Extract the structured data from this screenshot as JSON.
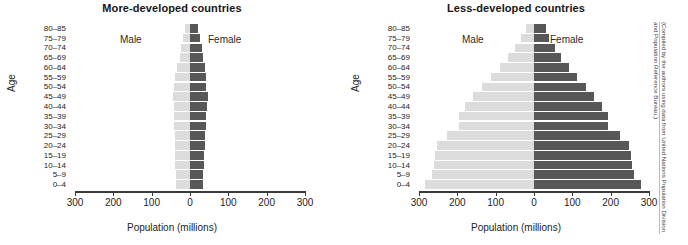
{
  "figure": {
    "credit": "(Compiled by the authors using data from United Nations Population Division and Population Reference Bureau.)"
  },
  "axis": {
    "xlabel": "Population (millions)",
    "ylabel": "Age",
    "ticks": [
      "300",
      "200",
      "100",
      "0",
      "100",
      "200",
      "300"
    ],
    "legend_male": "Male",
    "legend_female": "Female"
  },
  "chart_data": [
    {
      "type": "bar",
      "title": "More-developed countries",
      "xlabel": "Population (millions)",
      "ylabel": "Age",
      "xlim": [
        -300,
        300
      ],
      "xticks": [
        -300,
        -200,
        -100,
        0,
        100,
        200,
        300
      ],
      "xticklabels": [
        "300",
        "200",
        "100",
        "0",
        "100",
        "200",
        "300"
      ],
      "grid": false,
      "legend_position": "in-plot",
      "categories": [
        "80–85",
        "75–79",
        "70–74",
        "65–69",
        "60–64",
        "55–59",
        "50–54",
        "45–49",
        "40–44",
        "35–39",
        "30–34",
        "25–29",
        "20–24",
        "15–19",
        "10–14",
        "5–9",
        "0–4"
      ],
      "series": [
        {
          "name": "Male",
          "side": "left",
          "color": "#dcdcdc",
          "values": [
            12,
            19,
            24,
            27,
            34,
            38,
            41,
            45,
            43,
            42,
            41,
            40,
            39,
            39,
            38,
            36,
            36
          ]
        },
        {
          "name": "Female",
          "side": "right",
          "color": "#575757",
          "values": [
            22,
            27,
            31,
            33,
            38,
            41,
            43,
            46,
            44,
            42,
            41,
            40,
            38,
            37,
            36,
            34,
            34
          ]
        }
      ]
    },
    {
      "type": "bar",
      "title": "Less-developed countries",
      "xlabel": "Population (millions)",
      "ylabel": "Age",
      "xlim": [
        -300,
        300
      ],
      "xticks": [
        -300,
        -200,
        -100,
        0,
        100,
        200,
        300
      ],
      "xticklabels": [
        "300",
        "200",
        "100",
        "0",
        "100",
        "200",
        "300"
      ],
      "grid": false,
      "legend_position": "in-plot",
      "categories": [
        "80–85",
        "75–79",
        "70–74",
        "65–69",
        "60–64",
        "55–59",
        "50–54",
        "45–49",
        "40–44",
        "35–39",
        "30–34",
        "25–29",
        "20–24",
        "15–19",
        "10–14",
        "5–9",
        "0–4"
      ],
      "series": [
        {
          "name": "Male",
          "side": "left",
          "color": "#dcdcdc",
          "values": [
            22,
            34,
            50,
            68,
            88,
            112,
            135,
            158,
            180,
            196,
            196,
            228,
            252,
            258,
            260,
            265,
            285
          ]
        },
        {
          "name": "Female",
          "side": "right",
          "color": "#575757",
          "values": [
            30,
            40,
            55,
            70,
            90,
            113,
            135,
            157,
            178,
            192,
            192,
            224,
            248,
            254,
            256,
            262,
            278
          ]
        }
      ]
    }
  ]
}
